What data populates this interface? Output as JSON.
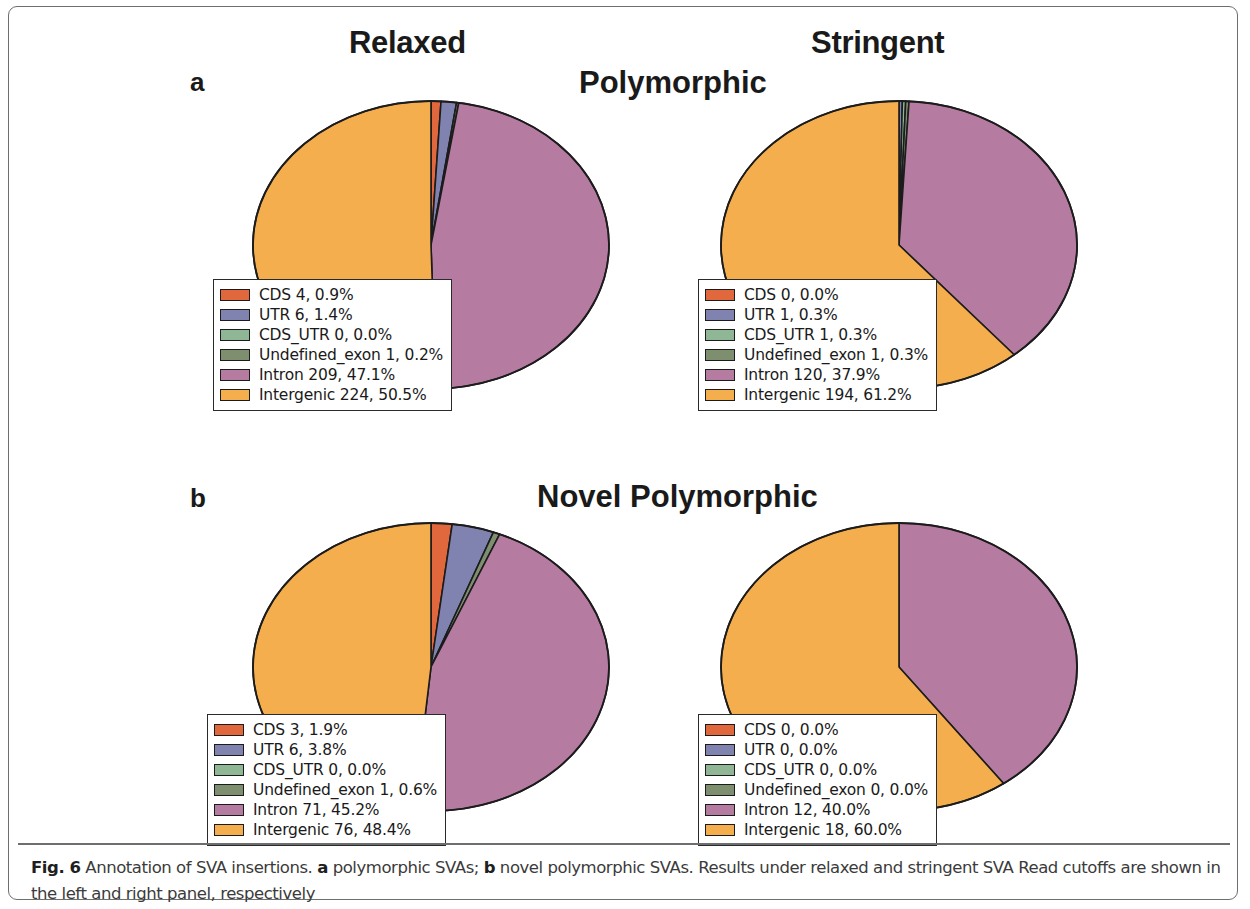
{
  "figure": {
    "column_headers": [
      "Relaxed",
      "Stringent"
    ],
    "panel_letters": [
      "a",
      "b"
    ],
    "row_titles": [
      "Polymorphic",
      "Novel Polymorphic"
    ],
    "caption": {
      "label": "Fig. 6",
      "text_1": " Annotation of SVA insertions. ",
      "bold_a": "a",
      "text_2": " polymorphic SVAs; ",
      "bold_b": "b",
      "text_3": " novel polymorphic SVAs. Results under relaxed and stringent SVA Read cutoffs are shown in the left and right panel, respectively"
    }
  },
  "colors": {
    "CDS": "#e1683c",
    "UTR": "#8083b0",
    "CDS_UTR": "#8fb795",
    "Undefined_exon": "#7e8f70",
    "Intron": "#b57ba0",
    "Intergenic": "#f5ae4e",
    "outline": "#1c1c1c",
    "frame": "#6d6e70"
  },
  "chart_data": [
    {
      "type": "pie",
      "id": "a-relaxed",
      "title": "Polymorphic — Relaxed",
      "panel": "a",
      "cutoff": "Relaxed",
      "categories": [
        "CDS",
        "UTR",
        "CDS_UTR",
        "Undefined_exon",
        "Intron",
        "Intergenic"
      ],
      "counts": [
        4,
        6,
        0,
        1,
        209,
        224
      ],
      "values": [
        0.9,
        1.4,
        0.0,
        0.2,
        47.1,
        50.5
      ],
      "colors": [
        "#e1683c",
        "#8083b0",
        "#8fb795",
        "#7e8f70",
        "#b57ba0",
        "#f5ae4e"
      ],
      "legend_position": "overlay-bottom-left",
      "legend": [
        "CDS 4,  0.9%",
        "UTR 6,  1.4%",
        "CDS_UTR 0,  0.0%",
        "Undefined_exon 1,  0.2%",
        "Intron 209,  47.1%",
        "Intergenic 224,  50.5%"
      ]
    },
    {
      "type": "pie",
      "id": "a-stringent",
      "title": "Polymorphic — Stringent",
      "panel": "a",
      "cutoff": "Stringent",
      "categories": [
        "CDS",
        "UTR",
        "CDS_UTR",
        "Undefined_exon",
        "Intron",
        "Intergenic"
      ],
      "counts": [
        0,
        1,
        1,
        1,
        120,
        194
      ],
      "values": [
        0.0,
        0.3,
        0.3,
        0.3,
        37.9,
        61.2
      ],
      "colors": [
        "#e1683c",
        "#8083b0",
        "#8fb795",
        "#7e8f70",
        "#b57ba0",
        "#f5ae4e"
      ],
      "legend_position": "overlay-bottom-left",
      "legend": [
        "CDS 0,  0.0%",
        "UTR 1,  0.3%",
        "CDS_UTR 1,  0.3%",
        "Undefined_exon 1,  0.3%",
        "Intron 120,  37.9%",
        "Intergenic 194,  61.2%"
      ]
    },
    {
      "type": "pie",
      "id": "b-relaxed",
      "title": "Novel Polymorphic — Relaxed",
      "panel": "b",
      "cutoff": "Relaxed",
      "categories": [
        "CDS",
        "UTR",
        "CDS_UTR",
        "Undefined_exon",
        "Intron",
        "Intergenic"
      ],
      "counts": [
        3,
        6,
        0,
        1,
        71,
        76
      ],
      "values": [
        1.9,
        3.8,
        0.0,
        0.6,
        45.2,
        48.4
      ],
      "colors": [
        "#e1683c",
        "#8083b0",
        "#8fb795",
        "#7e8f70",
        "#b57ba0",
        "#f5ae4e"
      ],
      "legend_position": "overlay-bottom-left",
      "legend": [
        "CDS 3,  1.9%",
        "UTR 6,  3.8%",
        "CDS_UTR 0,  0.0%",
        "Undefined_exon 1,  0.6%",
        "Intron 71,  45.2%",
        "Intergenic 76,  48.4%"
      ]
    },
    {
      "type": "pie",
      "id": "b-stringent",
      "title": "Novel Polymorphic — Stringent",
      "panel": "b",
      "cutoff": "Stringent",
      "categories": [
        "CDS",
        "UTR",
        "CDS_UTR",
        "Undefined_exon",
        "Intron",
        "Intergenic"
      ],
      "counts": [
        0,
        0,
        0,
        0,
        12,
        18
      ],
      "values": [
        0.0,
        0.0,
        0.0,
        0.0,
        40.0,
        60.0
      ],
      "colors": [
        "#e1683c",
        "#8083b0",
        "#8fb795",
        "#7e8f70",
        "#b57ba0",
        "#f5ae4e"
      ],
      "legend_position": "overlay-bottom-left",
      "legend": [
        "CDS 0,  0.0%",
        "UTR 0,  0.0%",
        "CDS_UTR 0,  0.0%",
        "Undefined_exon 0,  0.0%",
        "Intron 12,  40.0%",
        "Intergenic 18,  60.0%"
      ]
    }
  ]
}
